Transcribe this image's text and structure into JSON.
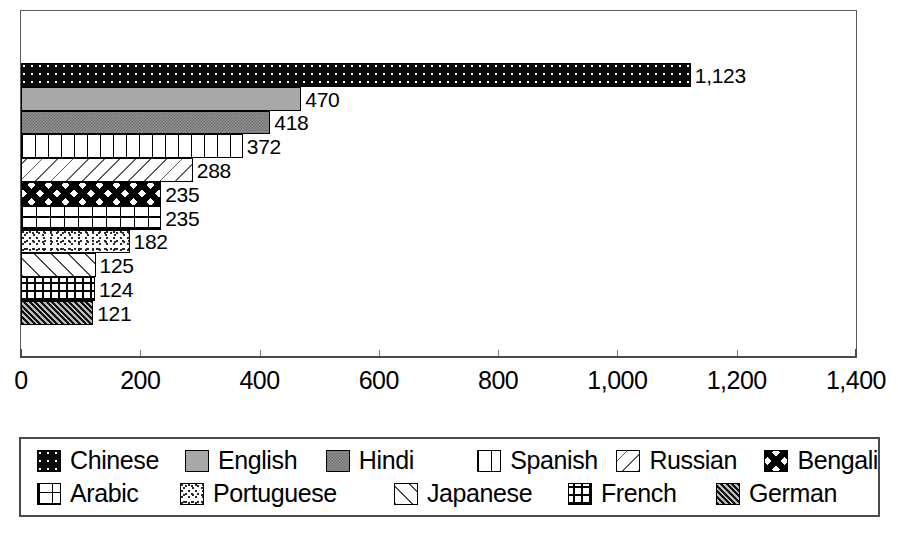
{
  "chart_data": {
    "type": "bar",
    "orientation": "horizontal",
    "title": "",
    "xlabel": "",
    "ylabel": "",
    "xlim": [
      0,
      1400
    ],
    "grid": false,
    "legend_position": "bottom",
    "categories": [
      "Chinese",
      "English",
      "Hindi",
      "Spanish",
      "Russian",
      "Bengali",
      "Arabic",
      "Portuguese",
      "Japanese",
      "French",
      "German"
    ],
    "values": [
      1123,
      470,
      418,
      372,
      288,
      235,
      235,
      182,
      125,
      124,
      121
    ],
    "value_labels": [
      "1,123",
      "470",
      "418",
      "372",
      "288",
      "235",
      "235",
      "182",
      "125",
      "124",
      "121"
    ],
    "tick_values": [
      0,
      200,
      400,
      600,
      800,
      1000,
      1200,
      1400
    ],
    "tick_labels": [
      "0",
      "200",
      "400",
      "600",
      "800",
      "1,000",
      "1,200",
      "1,400"
    ],
    "patterns": [
      "dotted-black",
      "solid-gray",
      "checker-gray",
      "vertical-stripes",
      "diagonal-hatch-light",
      "bold-lattice",
      "open-grid",
      "speckle",
      "diagonal-hatch",
      "brick-weave",
      "dense-crosshatch-dark"
    ],
    "series": [
      {
        "name": "Population (millions)",
        "values": [
          1123,
          470,
          418,
          372,
          288,
          235,
          235,
          182,
          125,
          124,
          121
        ]
      }
    ]
  },
  "legend": {
    "rows": [
      [
        {
          "label": "Chinese",
          "pattern_class": "pat-chinese",
          "swatch_name": "legend-swatch-chinese"
        },
        {
          "label": "English",
          "pattern_class": "pat-english",
          "swatch_name": "legend-swatch-english"
        },
        {
          "label": "Hindi",
          "pattern_class": "pat-hindi",
          "swatch_name": "legend-swatch-hindi"
        },
        {
          "label": "Spanish",
          "pattern_class": "pat-spanish",
          "swatch_name": "legend-swatch-spanish"
        },
        {
          "label": "Russian",
          "pattern_class": "pat-russian",
          "swatch_name": "legend-swatch-russian"
        },
        {
          "label": "Bengali",
          "pattern_class": "pat-bengali",
          "swatch_name": "legend-swatch-bengali"
        }
      ],
      [
        {
          "label": "Arabic",
          "pattern_class": "pat-arabic",
          "swatch_name": "legend-swatch-arabic"
        },
        {
          "label": "Portuguese",
          "pattern_class": "pat-portuguese",
          "swatch_name": "legend-swatch-portuguese"
        },
        {
          "label": "Japanese",
          "pattern_class": "pat-japanese",
          "swatch_name": "legend-swatch-japanese"
        },
        {
          "label": "French",
          "pattern_class": "pat-french",
          "swatch_name": "legend-swatch-french"
        },
        {
          "label": "German",
          "pattern_class": "pat-german",
          "swatch_name": "legend-swatch-german"
        }
      ]
    ],
    "row_item_widths": [
      [
        168,
        160,
        172,
        158,
        168,
        0
      ],
      [
        143,
        214,
        174,
        148,
        0
      ]
    ]
  },
  "colors": {
    "frame": "#5a5a5a",
    "axis": "#4a4a4a",
    "tick": "#7d7d7d",
    "text": "#000000",
    "background": "#ffffff"
  },
  "geometry": {
    "plot_left": 21,
    "plot_right": 856,
    "bars_top": 63,
    "bar_height": 23.8,
    "px_per_unit": 0.5964
  }
}
